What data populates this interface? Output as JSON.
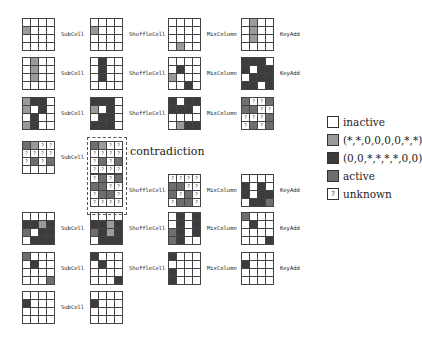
{
  "labels": {
    "subcell": "SubCell",
    "shuffle": "ShuffleCell",
    "mix": "MixColumn",
    "key": "KeyAdd"
  },
  "contradiction": "contradiction",
  "legend": [
    {
      "key": "w",
      "text": "inactive",
      "color": "#ffffff"
    },
    {
      "key": "l",
      "text": "(*,*,0,0,0,0,*,*)",
      "color": "#9a9a9a"
    },
    {
      "key": "d",
      "text": "(0,0,*,*,*,*,0,0)",
      "color": "#3c3c3c"
    },
    {
      "key": "a",
      "text": "active",
      "color": "#6e6e6e"
    },
    {
      "key": "u",
      "text": "unknown",
      "symbol": "?"
    }
  ],
  "rows": [
    {
      "y": 18,
      "grids": [
        {
          "x": 22,
          "cells": "wwww lwww wwww wwww"
        },
        {
          "x": 90,
          "cells": "wwww lwww wwww wwww"
        },
        {
          "x": 168,
          "cells": "wwww wwww wwww wlww"
        },
        {
          "x": 241,
          "cells": "wlww wlww wlww wwww"
        }
      ],
      "labels": [
        "subcell",
        "shuffle",
        "mix",
        "key"
      ]
    },
    {
      "y": 57,
      "grids": [
        {
          "x": 22,
          "cells": "wlww wlww wlww wwww"
        },
        {
          "x": 90,
          "cells": "wdww wdww wdww wwww"
        },
        {
          "x": 168,
          "cells": "wwww wdww lwww wwdw"
        },
        {
          "x": 241,
          "cells": "dddw dwdd wddd ddwd"
        }
      ],
      "labels": [
        "subcell",
        "shuffle",
        "mix",
        "key"
      ]
    },
    {
      "y": 97,
      "grids": [
        {
          "x": 22,
          "cells": "lddw lwdw wdww ldww"
        },
        {
          "x": 90,
          "cells": "dddw lwdw wddw dddw"
        },
        {
          "x": 168,
          "cells": "dwdd dddw wwww wldd"
        },
        {
          "x": 241,
          "cells": "auua aauu uuua uaua"
        }
      ],
      "labels": [
        "subcell",
        "shuffle",
        "mix",
        null
      ]
    },
    {
      "y": 141,
      "grids": [
        {
          "x": 22,
          "cells": "aluu uuuu uaua wwww"
        },
        {
          "x": 90,
          "cells": "aluu uuuu uaua uuuu"
        }
      ],
      "labels": [
        "subcell",
        null
      ]
    },
    {
      "y": 174,
      "grids": [
        {
          "x": 90,
          "cells": "uaua aauu uaau uuuu"
        },
        {
          "x": 168,
          "cells": "uuuu aauu auau uaau"
        },
        {
          "x": 241,
          "cells": "wwww dwdw dwdd wdda"
        }
      ],
      "labels": [
        "shuffle",
        "mix",
        "key"
      ]
    },
    {
      "y": 212,
      "grids": [
        {
          "x": 22,
          "cells": "wwww ddld awdd wddd"
        },
        {
          "x": 90,
          "cells": "wwww ddld adld wddd"
        },
        {
          "x": 168,
          "cells": "wdwd wdwd adwd adww"
        },
        {
          "x": 241,
          "cells": "awww wdww wwww wwwd"
        }
      ],
      "labels": [
        "subcell",
        "shuffle",
        "mix",
        "key"
      ]
    },
    {
      "y": 252,
      "grids": [
        {
          "x": 22,
          "cells": "awww wdww wwww wwwa"
        },
        {
          "x": 90,
          "cells": "dwww wdww wwww wwwd"
        },
        {
          "x": 168,
          "cells": "dwww wwww dwww dwww"
        },
        {
          "x": 241,
          "cells": "wwww dwww wwww wwww"
        }
      ],
      "labels": [
        "subcell",
        "shuffle",
        "mix",
        "key"
      ]
    },
    {
      "y": 291,
      "grids": [
        {
          "x": 22,
          "cells": "wwww dwww wwww wwww"
        },
        {
          "x": 90,
          "cells": "wwww dwww wwww wwww"
        }
      ],
      "labels": [
        "subcell",
        null
      ]
    }
  ]
}
